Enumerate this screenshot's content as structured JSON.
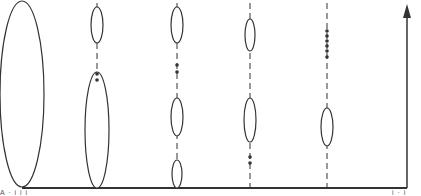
{
  "diagram": {
    "stroke_color": "#333333",
    "background": "#ffffff",
    "baseline": {
      "x1": 22,
      "x2": 407,
      "y": 188
    },
    "arrow": {
      "x": 407,
      "y_top": 4,
      "y_bottom": 188
    },
    "columns": [
      {
        "x": 22,
        "dashed": false,
        "ellipses": [
          {
            "cy": 94,
            "rx": 22,
            "ry": 93
          }
        ],
        "dots": []
      },
      {
        "x": 97,
        "dashed": true,
        "ellipses": [
          {
            "cy": 25,
            "rx": 6,
            "ry": 18
          },
          {
            "cy": 130,
            "rx": 12,
            "ry": 58
          }
        ],
        "dots": [
          74,
          80
        ]
      },
      {
        "x": 177,
        "dashed": true,
        "ellipses": [
          {
            "cy": 25,
            "rx": 6,
            "ry": 18
          },
          {
            "cy": 117,
            "rx": 6,
            "ry": 19
          },
          {
            "cy": 174,
            "rx": 5,
            "ry": 14
          }
        ],
        "dots": [
          65,
          72
        ]
      },
      {
        "x": 250,
        "dashed": true,
        "ellipses": [
          {
            "cy": 35,
            "rx": 5,
            "ry": 16
          },
          {
            "cy": 120,
            "rx": 6,
            "ry": 22
          }
        ],
        "dots": [
          157,
          163
        ]
      },
      {
        "x": 327,
        "dashed": true,
        "ellipses": [
          {
            "cy": 127,
            "rx": 6,
            "ry": 19
          }
        ],
        "dots": [
          31,
          36,
          41,
          46,
          51,
          57
        ]
      }
    ],
    "bottom_fragments": {
      "left": "A · i i i",
      "right": "i · i"
    }
  }
}
